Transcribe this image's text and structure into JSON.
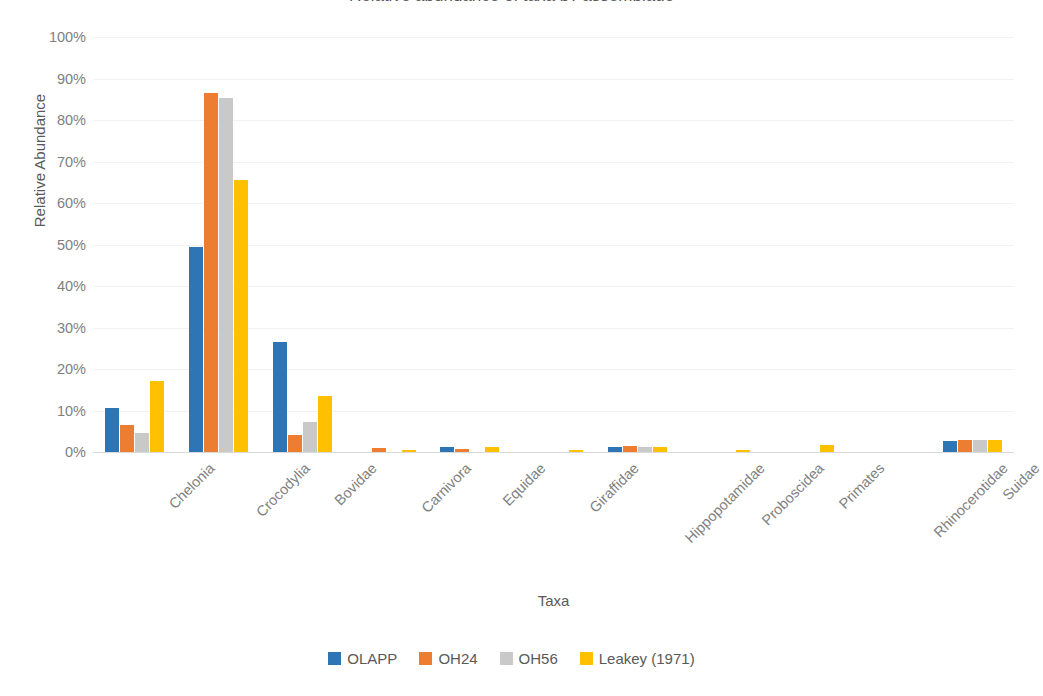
{
  "chart_data": {
    "type": "bar",
    "title": "Relative abundance of taxa by assemblage",
    "xlabel": "Taxa",
    "ylabel": "Relative Abundance",
    "ylim": [
      0,
      100
    ],
    "ytick_labels": [
      "100%",
      "90%",
      "80%",
      "70%",
      "60%",
      "50%",
      "40%",
      "30%",
      "20%",
      "10%",
      "0%"
    ],
    "ytick_values": [
      100,
      90,
      80,
      70,
      60,
      50,
      40,
      30,
      20,
      10,
      0
    ],
    "grid": true,
    "legend_position": "bottom",
    "categories": [
      "Chelonia",
      "Crocodylia",
      "Bovidae",
      "Carnivora",
      "Equidae",
      "Giraffidae",
      "Hippopotamidae",
      "Proboscidea",
      "Primates",
      "Rhinocerotidae",
      "Suidae"
    ],
    "series": [
      {
        "name": "OLAPP",
        "color": "#2E75B6",
        "values": [
          10.7,
          49.5,
          26.4,
          0.0,
          1.3,
          0.0,
          1.2,
          0.0,
          0.0,
          0.0,
          2.6
        ]
      },
      {
        "name": "OH24",
        "color": "#ED7D31",
        "values": [
          6.5,
          86.5,
          4.2,
          0.9,
          0.8,
          0.0,
          1.5,
          0.0,
          0.0,
          0.0,
          2.8
        ]
      },
      {
        "name": "OH56",
        "color": "#C9C9C9",
        "values": [
          4.7,
          85.3,
          7.3,
          0.0,
          0.0,
          0.0,
          1.3,
          0.0,
          0.0,
          0.0,
          2.8
        ]
      },
      {
        "name": "Leakey (1971)",
        "color": "#FFC000",
        "values": [
          17.0,
          65.5,
          13.4,
          0.5,
          1.1,
          0.6,
          1.3,
          0.4,
          1.7,
          0.0,
          2.9
        ]
      }
    ]
  },
  "legend": {
    "items": [
      {
        "label": "OLAPP",
        "color": "#2E75B6"
      },
      {
        "label": "OH24",
        "color": "#ED7D31"
      },
      {
        "label": "OH56",
        "color": "#C9C9C9"
      },
      {
        "label": "Leakey (1971)",
        "color": "#FFC000"
      }
    ]
  }
}
